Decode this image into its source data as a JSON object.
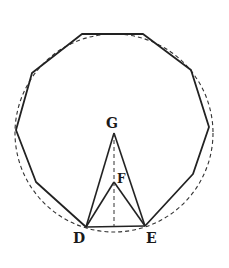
{
  "figure": {
    "colors": {
      "stroke": "#222222",
      "dashed": "#333333",
      "background": "#ffffff"
    },
    "circle": {
      "cx": 114,
      "cy": 133,
      "r": 99,
      "style": "dashed"
    },
    "polygon": {
      "sides": 11,
      "vertices": [
        [
          82,
          34
        ],
        [
          143,
          34
        ],
        [
          191,
          70
        ],
        [
          209,
          127
        ],
        [
          193,
          174
        ],
        [
          145,
          226
        ],
        [
          86,
          227
        ],
        [
          36,
          182
        ],
        [
          16,
          130
        ],
        [
          32,
          73
        ]
      ]
    },
    "points": {
      "G": {
        "x": 114,
        "y": 133,
        "label": "G",
        "lx": 106,
        "ly": 128
      },
      "F": {
        "x": 114,
        "y": 182,
        "label": "F",
        "lx": 117,
        "ly": 183
      },
      "D": {
        "x": 86,
        "y": 227,
        "label": "D",
        "lx": 73,
        "ly": 243
      },
      "E": {
        "x": 145,
        "y": 226,
        "label": "E",
        "lx": 146,
        "ly": 243
      }
    },
    "segments": [
      {
        "from": "D",
        "to": "G",
        "style": "solid"
      },
      {
        "from": "E",
        "to": "G",
        "style": "solid"
      },
      {
        "from": "D",
        "to": "F",
        "style": "solid"
      },
      {
        "from": "E",
        "to": "F",
        "style": "solid"
      },
      {
        "from": "D",
        "to": "E",
        "style": "solid"
      },
      {
        "from": "G",
        "to": "midDE",
        "style": "dashed"
      }
    ],
    "labels": [
      "G",
      "F",
      "D",
      "E"
    ]
  }
}
